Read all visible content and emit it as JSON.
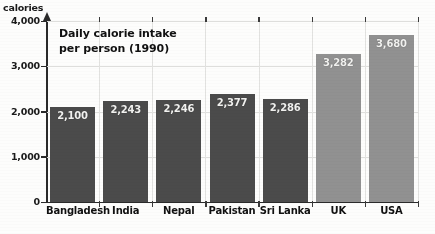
{
  "chart_data": {
    "type": "bar",
    "title": "Daily calorie intake per person (1990)",
    "title_line1": "Daily calorie intake",
    "title_line2": "per person (1990)",
    "xlabel": "",
    "ylabel": "calories",
    "ylim": [
      0,
      4000
    ],
    "ytick_labels": [
      "4,000",
      "3,000",
      "2,000",
      "1,000",
      "0"
    ],
    "ytick_values": [
      4000,
      3000,
      2000,
      1000,
      0
    ],
    "grid": "faint horizontal gridlines at 3,000 and 4,000; faint vertical gridlines between categories",
    "legend": "none",
    "categories": [
      "Bangladesh",
      "India",
      "Nepal",
      "Pakistan",
      "Sri Lanka",
      "UK",
      "USA"
    ],
    "values": [
      2100,
      2243,
      2246,
      2377,
      2286,
      3282,
      3680
    ],
    "value_labels": [
      "2,100",
      "2,243",
      "2,246",
      "2,377",
      "2,286",
      "3,282",
      "3,680"
    ],
    "bar_colors": [
      "#4b4b4b",
      "#4b4b4b",
      "#4b4b4b",
      "#4b4b4b",
      "#4b4b4b",
      "#919191",
      "#919191"
    ],
    "bar_group_note": "first five bars dark grey, UK and USA light grey"
  },
  "colors": {
    "bar_dark": "#4b4b4b",
    "bar_light": "#919191",
    "axis": "#2a2a2a",
    "gridline": "#dededc",
    "background": "#fdfdfc",
    "value_text": "#f2f2f0",
    "label_text": "#111111"
  }
}
